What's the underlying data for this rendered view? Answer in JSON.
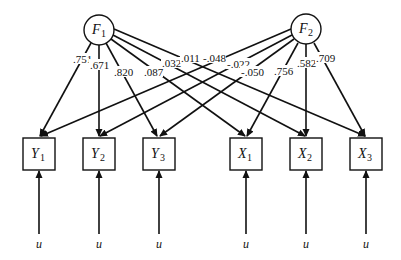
{
  "diagram": {
    "type": "path-diagram",
    "factors": [
      {
        "id": "F1",
        "letter": "F",
        "sub": "1",
        "cx": 99,
        "cy": 30
      },
      {
        "id": "F2",
        "letter": "F",
        "sub": "2",
        "cx": 306,
        "cy": 29
      }
    ],
    "indicators": [
      {
        "id": "Y1",
        "letter": "Y",
        "sub": "1",
        "x": 23
      },
      {
        "id": "Y2",
        "letter": "Y",
        "sub": "2",
        "x": 83
      },
      {
        "id": "Y3",
        "letter": "Y",
        "sub": "3",
        "x": 143
      },
      {
        "id": "X1",
        "letter": "X",
        "sub": "1",
        "x": 230
      },
      {
        "id": "X2",
        "letter": "X",
        "sub": "2",
        "x": 290
      },
      {
        "id": "X3",
        "letter": "X",
        "sub": "3",
        "x": 350
      }
    ],
    "error_label": "u",
    "loadings": {
      "F1": [
        {
          "to": "Y1",
          "value": ".751"
        },
        {
          "to": "Y2",
          "value": ".671"
        },
        {
          "to": "Y3",
          "value": ".820"
        },
        {
          "to": "X1",
          "value": ".087"
        },
        {
          "to": "X2",
          "value": ".032"
        },
        {
          "to": "X3",
          "value": ".011"
        }
      ],
      "F2": [
        {
          "to": "Y1",
          "value": "-.048"
        },
        {
          "to": "Y2",
          "value": "-.022"
        },
        {
          "to": "Y3",
          "value": "-.050"
        },
        {
          "to": "X1",
          "value": ".756"
        },
        {
          "to": "X2",
          "value": ".582"
        },
        {
          "to": "X3",
          "value": ".709"
        }
      ]
    }
  }
}
